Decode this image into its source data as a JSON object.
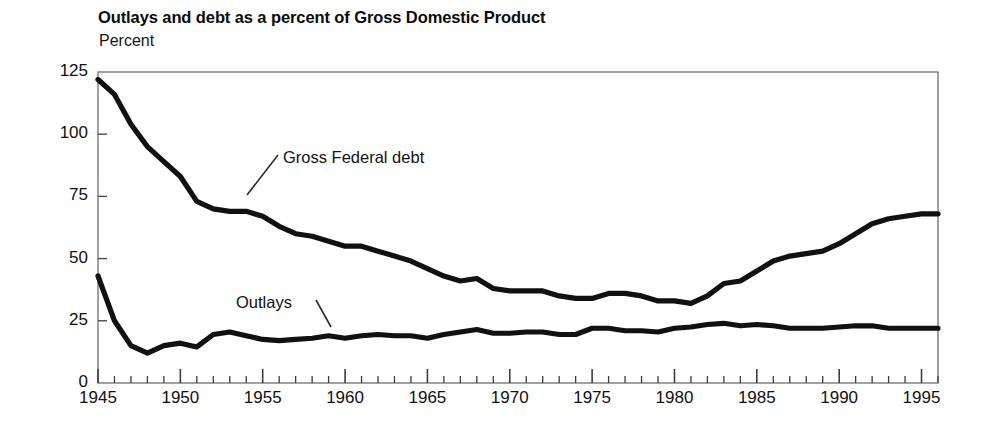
{
  "chart_data": {
    "type": "line",
    "title": "Outlays and debt as a percent of Gross Domestic Product",
    "ylabel": "Percent",
    "xlabel": "",
    "grid": false,
    "legend_position": "inline-annotation",
    "xlim": [
      1945,
      1996
    ],
    "ylim": [
      0,
      125
    ],
    "yticks": [
      0,
      25,
      50,
      75,
      100,
      125
    ],
    "ytick_labels": [
      "0",
      "25",
      "50",
      "75",
      "100",
      "125"
    ],
    "xticks": [
      1945,
      1950,
      1955,
      1960,
      1965,
      1970,
      1975,
      1980,
      1985,
      1990,
      1995
    ],
    "xtick_labels": [
      "1945",
      "1950",
      "1955",
      "1960",
      "1965",
      "1970",
      "1975",
      "1980",
      "1985",
      "1990",
      "1995"
    ],
    "minor_xtick_interval": 1,
    "x": [
      1945,
      1946,
      1947,
      1948,
      1949,
      1950,
      1951,
      1952,
      1953,
      1954,
      1955,
      1956,
      1957,
      1958,
      1959,
      1960,
      1961,
      1962,
      1963,
      1964,
      1965,
      1966,
      1967,
      1968,
      1969,
      1970,
      1971,
      1972,
      1973,
      1974,
      1975,
      1976,
      1977,
      1978,
      1979,
      1980,
      1981,
      1982,
      1983,
      1984,
      1985,
      1986,
      1987,
      1988,
      1989,
      1990,
      1991,
      1992,
      1993,
      1994,
      1995,
      1996
    ],
    "series": [
      {
        "name": "Gross Federal debt",
        "color": "#111111",
        "values": [
          122.0,
          116.0,
          104.0,
          95.0,
          89.0,
          83.0,
          73.0,
          70.0,
          69.0,
          69.0,
          67.0,
          63.0,
          60.0,
          59.0,
          57.0,
          55.0,
          55.0,
          53.0,
          51.0,
          49.0,
          46.0,
          43.0,
          41.0,
          42.0,
          38.0,
          37.0,
          37.0,
          37.0,
          35.0,
          34.0,
          34.0,
          36.0,
          36.0,
          35.0,
          33.0,
          33.0,
          32.0,
          35.0,
          40.0,
          41.0,
          45.0,
          49.0,
          51.0,
          52.0,
          53.0,
          56.0,
          60.0,
          64.0,
          66.0,
          67.0,
          68.0,
          68.0
        ]
      },
      {
        "name": "Outlays",
        "color": "#111111",
        "values": [
          43.0,
          25.0,
          15.0,
          12.0,
          15.0,
          16.0,
          14.5,
          19.5,
          20.5,
          19.0,
          17.5,
          17.0,
          17.5,
          18.0,
          19.0,
          18.0,
          19.0,
          19.5,
          19.0,
          19.0,
          18.0,
          19.5,
          20.5,
          21.5,
          20.0,
          20.0,
          20.5,
          20.5,
          19.5,
          19.5,
          22.0,
          22.0,
          21.0,
          21.0,
          20.5,
          22.0,
          22.5,
          23.5,
          24.0,
          23.0,
          23.5,
          23.0,
          22.0,
          22.0,
          22.0,
          22.5,
          23.0,
          23.0,
          22.0,
          22.0,
          22.0,
          22.0
        ]
      }
    ],
    "annotations": [
      {
        "text": "Gross Federal debt",
        "series": "Gross Federal debt"
      },
      {
        "text": "Outlays",
        "series": "Outlays"
      }
    ]
  }
}
